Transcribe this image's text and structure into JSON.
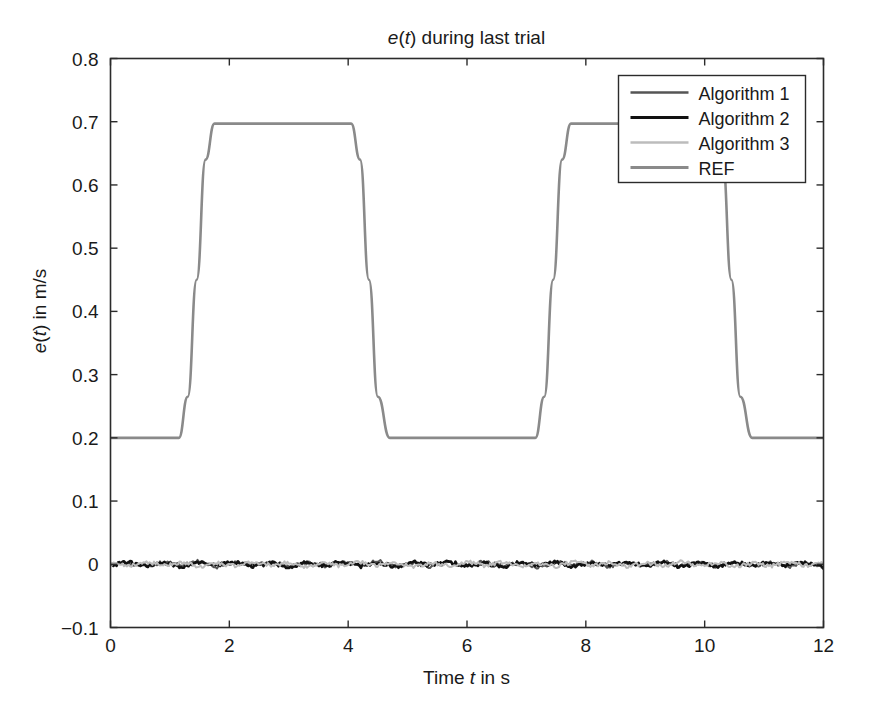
{
  "chart_data": {
    "type": "line",
    "title": "e(t) during last trial",
    "title_parts": {
      "pre_italic": "e",
      "paren_open": "(",
      "italic2": "t",
      "paren_close": ")",
      "rest": " during last trial"
    },
    "xlabel": "Time t in s",
    "xlabel_parts": {
      "pre": "Time ",
      "italic": "t",
      "post": " in s"
    },
    "ylabel": "e(t) in m/s",
    "ylabel_parts": {
      "italic1": "e",
      "paren_open": "(",
      "italic2": "t",
      "paren_close": ")",
      "post": " in m/s"
    },
    "xlim": [
      0,
      12
    ],
    "ylim": [
      -0.1,
      0.8
    ],
    "xticks": [
      0,
      2,
      4,
      6,
      8,
      10,
      12
    ],
    "xticklabels": [
      "0",
      "2",
      "4",
      "6",
      "8",
      "10",
      "12"
    ],
    "yticks": [
      -0.1,
      0,
      0.1,
      0.2,
      0.3,
      0.4,
      0.5,
      0.6,
      0.7,
      0.8
    ],
    "yticklabels": [
      "−0.1",
      "0",
      "0.1",
      "0.2",
      "0.3",
      "0.4",
      "0.5",
      "0.6",
      "0.7",
      "0.8"
    ],
    "grid": false,
    "frame": "box",
    "legend_position": "upper-right",
    "legend_entries": [
      "Algorithm 1",
      "Algorithm 2",
      "Algorithm 3",
      "REF"
    ],
    "series": [
      {
        "name": "Algorithm 1",
        "color": "#555555",
        "linewidth": 2.0,
        "description": "Tracking error near zero with small high-frequency noise",
        "x": [
          0.0,
          0.3,
          0.6,
          0.9,
          1.2,
          1.5,
          1.8,
          2.1,
          2.4,
          2.7,
          3.0,
          3.3,
          3.6,
          3.9,
          4.2,
          4.5,
          4.8,
          5.1,
          5.4,
          5.7,
          6.0,
          6.3,
          6.6,
          6.9,
          7.2,
          7.5,
          7.8,
          8.1,
          8.4,
          8.7,
          9.0,
          9.3,
          9.6,
          9.9,
          10.2,
          10.5,
          10.8,
          11.1,
          11.4,
          11.7,
          12.0
        ],
        "y": [
          0.0,
          0.002,
          -0.003,
          0.004,
          -0.002,
          0.005,
          -0.004,
          0.003,
          -0.002,
          0.004,
          -0.003,
          0.002,
          -0.004,
          0.003,
          -0.002,
          0.005,
          -0.003,
          0.002,
          -0.004,
          0.003,
          -0.002,
          0.004,
          -0.003,
          0.002,
          -0.005,
          0.004,
          -0.002,
          0.003,
          -0.004,
          0.002,
          -0.003,
          0.004,
          -0.002,
          0.003,
          -0.004,
          0.002,
          -0.003,
          0.002,
          -0.004,
          0.002,
          -0.003
        ]
      },
      {
        "name": "Algorithm 2",
        "color": "#111111",
        "linewidth": 2.6,
        "description": "Tracking error near zero with small high-frequency noise",
        "x": [
          0.0,
          0.3,
          0.6,
          0.9,
          1.2,
          1.5,
          1.8,
          2.1,
          2.4,
          2.7,
          3.0,
          3.3,
          3.6,
          3.9,
          4.2,
          4.5,
          4.8,
          5.1,
          5.4,
          5.7,
          6.0,
          6.3,
          6.6,
          6.9,
          7.2,
          7.5,
          7.8,
          8.1,
          8.4,
          8.7,
          9.0,
          9.3,
          9.6,
          9.9,
          10.2,
          10.5,
          10.8,
          11.1,
          11.4,
          11.7,
          12.0
        ],
        "y": [
          -0.001,
          0.003,
          -0.002,
          0.002,
          -0.004,
          0.003,
          -0.002,
          0.004,
          -0.003,
          0.002,
          -0.004,
          0.003,
          -0.002,
          0.004,
          -0.003,
          0.002,
          -0.004,
          0.003,
          -0.002,
          0.004,
          -0.003,
          0.002,
          -0.004,
          0.003,
          -0.002,
          0.003,
          -0.004,
          0.002,
          -0.003,
          0.004,
          -0.002,
          0.003,
          -0.004,
          0.002,
          -0.003,
          0.004,
          -0.002,
          0.003,
          -0.002,
          0.003,
          -0.004
        ]
      },
      {
        "name": "Algorithm 3",
        "color": "#bcbcbc",
        "linewidth": 2.0,
        "description": "Tracking error near zero with small high-frequency noise",
        "x": [
          0.0,
          0.3,
          0.6,
          0.9,
          1.2,
          1.5,
          1.8,
          2.1,
          2.4,
          2.7,
          3.0,
          3.3,
          3.6,
          3.9,
          4.2,
          4.5,
          4.8,
          5.1,
          5.4,
          5.7,
          6.0,
          6.3,
          6.6,
          6.9,
          7.2,
          7.5,
          7.8,
          8.1,
          8.4,
          8.7,
          9.0,
          9.3,
          9.6,
          9.9,
          10.2,
          10.5,
          10.8,
          11.1,
          11.4,
          11.7,
          12.0
        ],
        "y": [
          0.001,
          -0.003,
          0.004,
          -0.002,
          0.003,
          -0.004,
          0.002,
          -0.003,
          0.004,
          -0.002,
          0.003,
          -0.004,
          0.002,
          -0.003,
          0.004,
          -0.002,
          0.003,
          -0.004,
          0.002,
          -0.003,
          0.004,
          -0.002,
          0.003,
          -0.004,
          0.002,
          -0.003,
          0.004,
          -0.002,
          0.003,
          -0.004,
          0.002,
          -0.003,
          0.004,
          -0.002,
          0.003,
          -0.004,
          0.002,
          -0.003,
          0.004,
          -0.002,
          0.002
        ]
      },
      {
        "name": "REF",
        "color": "#8a8a8a",
        "linewidth": 2.6,
        "description": "Reference trapezoidal velocity profile: baseline 0.2 m/s with two pulses to 0.7 m/s",
        "x": [
          0.0,
          1.15,
          1.3,
          1.45,
          1.6,
          1.75,
          4.05,
          4.2,
          4.35,
          4.5,
          4.7,
          7.15,
          7.3,
          7.45,
          7.6,
          7.75,
          10.15,
          10.3,
          10.45,
          10.6,
          10.8,
          12.0
        ],
        "y": [
          0.2,
          0.2,
          0.265,
          0.45,
          0.64,
          0.697,
          0.697,
          0.64,
          0.45,
          0.265,
          0.2,
          0.2,
          0.265,
          0.45,
          0.64,
          0.697,
          0.697,
          0.64,
          0.45,
          0.265,
          0.2,
          0.2
        ]
      }
    ],
    "baseline_value": 0.2,
    "plateau_value": 0.7,
    "pulse_intervals": [
      [
        1.15,
        4.7
      ],
      [
        7.15,
        10.8
      ]
    ]
  },
  "colors": {
    "background": "#ffffff",
    "axis": "#2b2b2b",
    "text": "#1a1a1a",
    "algorithm1": "#555555",
    "algorithm2": "#111111",
    "algorithm3": "#bcbcbc",
    "ref": "#8a8a8a"
  }
}
